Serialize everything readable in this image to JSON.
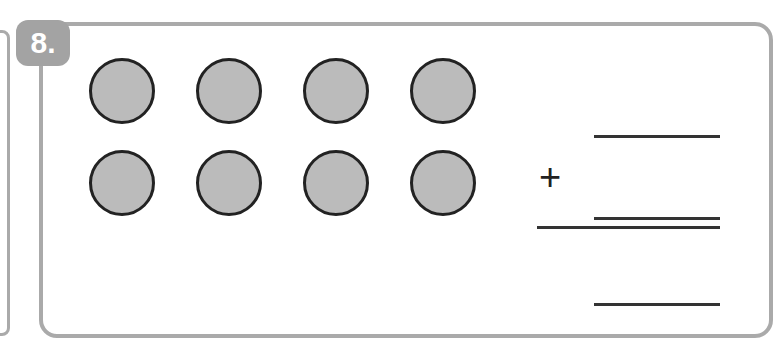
{
  "problem": {
    "number": "8.",
    "operator": "+"
  },
  "counters": {
    "rows": 2,
    "per_row": 4,
    "total": 8,
    "fill": "#bbbbbb"
  },
  "answer_blanks": 4
}
